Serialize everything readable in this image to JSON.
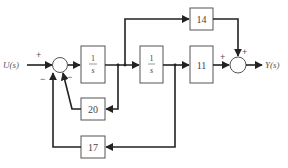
{
  "diagram": {
    "input_label": "U(s)",
    "output_label": "Y(s)",
    "blocks": {
      "integrator1": {
        "num": "1",
        "den": "s"
      },
      "integrator2": {
        "num": "1",
        "den": "s"
      },
      "gain_14": "14",
      "gain_11": "11",
      "gain_20": "20",
      "gain_17": "17"
    },
    "sum1_signs": {
      "input": "+",
      "fb20": "−",
      "fb17": "−"
    },
    "sum2_signs": {
      "from_11": "+",
      "from_14": "+"
    },
    "colors": {
      "line": "#222222",
      "block_border": "#555555",
      "text": "#444444"
    }
  }
}
